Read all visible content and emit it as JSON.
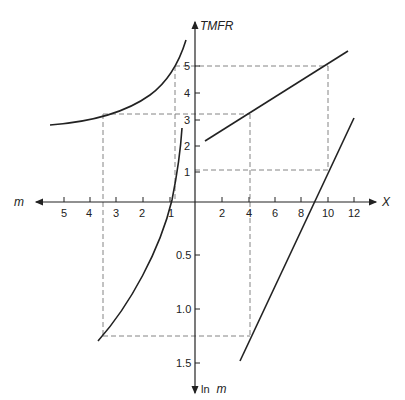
{
  "axes": {
    "top": {
      "name": "TMFR",
      "ticks": [
        "5",
        "4",
        "3",
        "2",
        "1"
      ]
    },
    "left": {
      "name": "m",
      "ticks": [
        "5",
        "4",
        "3",
        "2",
        "1"
      ]
    },
    "right": {
      "name": "X",
      "ticks": [
        "2",
        "4",
        "6",
        "8",
        "10",
        "12"
      ]
    },
    "bottom": {
      "name_prefix": "ln",
      "name_var": "m",
      "ticks": [
        "0.5",
        "1.0",
        "1.5"
      ]
    }
  },
  "curves": [
    {
      "id": "tmfr-vs-m",
      "quadrant": "upper-left",
      "description": "TMFR rising steeply as m approaches 1"
    },
    {
      "id": "tmfr-vs-x",
      "quadrant": "upper-right",
      "description": "linear TMFR vs X"
    },
    {
      "id": "lnm-vs-m",
      "quadrant": "lower-left",
      "description": "ln m vs m"
    },
    {
      "id": "x-vs-lnm",
      "quadrant": "lower-right",
      "description": "linear X vs ln m"
    }
  ],
  "colors": {
    "ink": "#222222",
    "dashed": "#777777",
    "background": "#ffffff"
  }
}
